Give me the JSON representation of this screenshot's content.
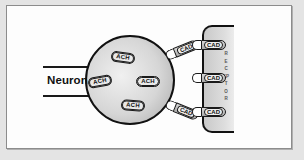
{
  "diagram": {
    "neuron_label": "Neuron",
    "receptor_label": "RECEPTOR",
    "soma_molecules": [
      {
        "label": "ACH"
      },
      {
        "label": "ACH"
      },
      {
        "label": "ACH"
      },
      {
        "label": "ACH"
      }
    ],
    "free_molecules": [
      {
        "label": "CAD"
      },
      {
        "label": "CAD"
      }
    ],
    "bound_molecules": [
      {
        "label": "CAD"
      },
      {
        "label": "CAD"
      },
      {
        "label": "CAD"
      }
    ]
  },
  "colors": {
    "background": "#e4e4e4",
    "panel": "#fdfdfd",
    "outline": "#111111",
    "molecule_fill": "#a8a8a8"
  }
}
